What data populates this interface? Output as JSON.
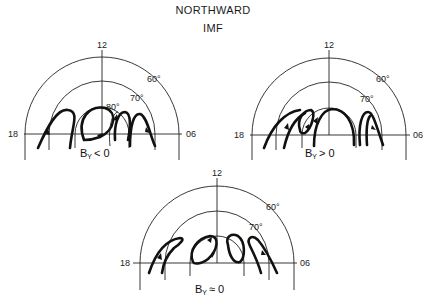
{
  "title": {
    "line1": "NORTHWARD",
    "line2": "IMF"
  },
  "panels": [
    {
      "id": "by-negative",
      "caption_main": "B",
      "caption_sub": "Y",
      "caption_rel": "< 0",
      "mlt_top": "12",
      "mlt_left": "18",
      "mlt_right": "06",
      "lat_labels": [
        "60°",
        "70°",
        "80°"
      ]
    },
    {
      "id": "by-positive",
      "caption_main": "B",
      "caption_sub": "Y",
      "caption_rel": "> 0",
      "mlt_top": "12",
      "mlt_left": "18",
      "mlt_right": "06",
      "lat_labels": [
        "60°",
        "70°"
      ]
    },
    {
      "id": "by-zero",
      "caption_main": "B",
      "caption_sub": "Y",
      "caption_rel": "≈ 0",
      "mlt_top": "12",
      "mlt_left": "18",
      "mlt_right": "06",
      "lat_labels": [
        "60°",
        "70°"
      ]
    }
  ]
}
